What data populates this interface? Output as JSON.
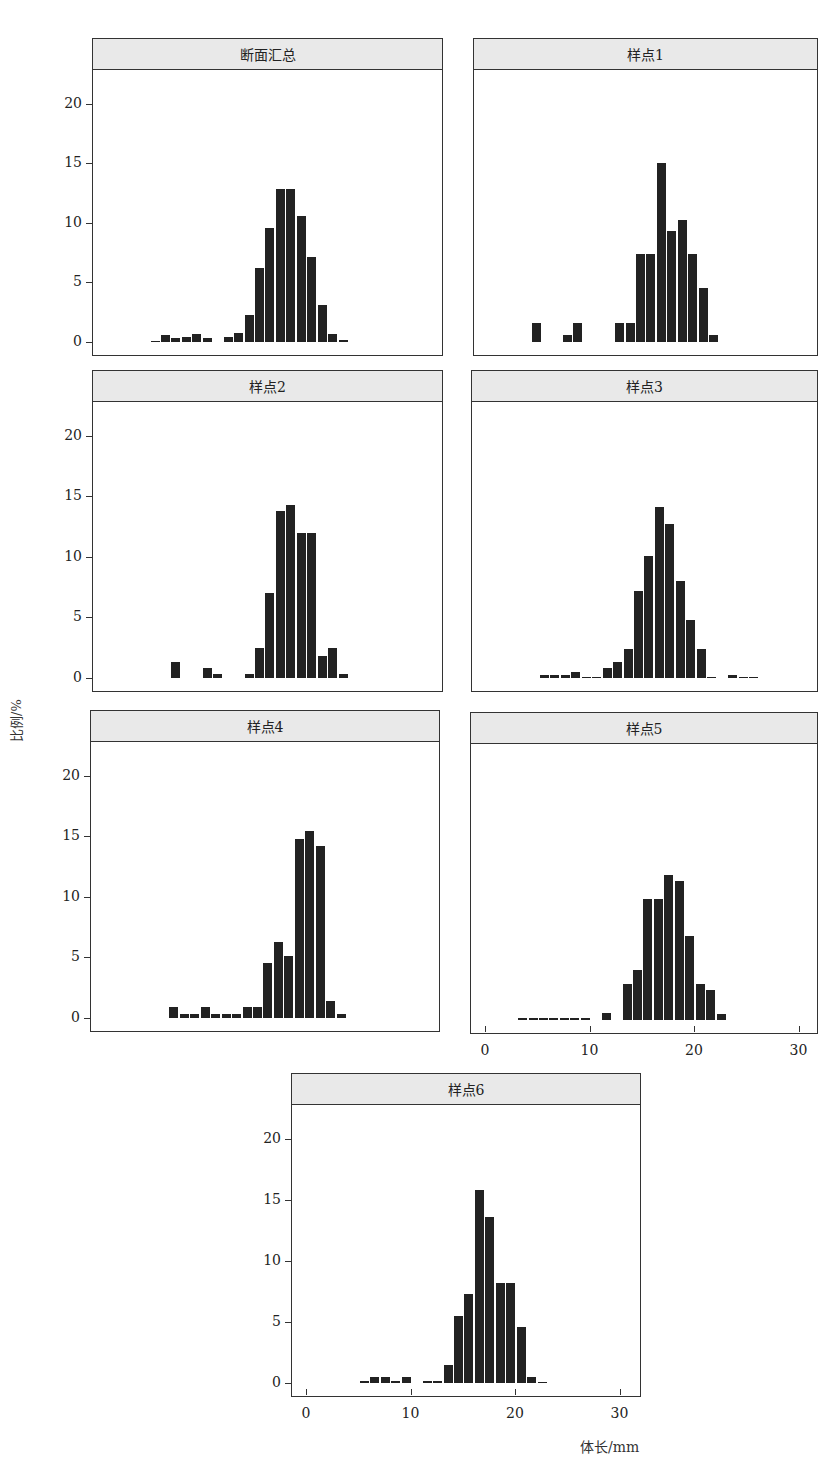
{
  "figure": {
    "y_axis_title": "比例/%",
    "x_axis_title": "体长/mm",
    "caption": "图"
  },
  "chart_data": [
    {
      "type": "bar",
      "title": "断面汇总",
      "xlabel": "体长/mm",
      "ylabel": "比例/%",
      "xlim": [
        0,
        30
      ],
      "ylim": [
        0,
        20
      ],
      "yticks": [
        0,
        5,
        10,
        15,
        20
      ],
      "x": [
        4,
        5,
        6,
        7,
        8,
        9,
        11,
        12,
        13,
        14,
        15,
        16,
        17,
        18,
        19,
        20,
        21,
        22
      ],
      "values": [
        0.1,
        0.6,
        0.3,
        0.4,
        0.7,
        0.3,
        0.4,
        0.75,
        2.3,
        6.2,
        9.6,
        12.8,
        12.8,
        10.6,
        7.1,
        3.1,
        0.65,
        0.2
      ]
    },
    {
      "type": "bar",
      "title": "样点1",
      "xlabel": "体长/mm",
      "ylabel": "比例/%",
      "xlim": [
        0,
        30
      ],
      "ylim": [
        0,
        20
      ],
      "x": [
        4,
        7,
        8,
        12,
        13,
        14,
        15,
        16,
        17,
        18,
        19,
        20,
        21
      ],
      "values": [
        1.6,
        0.6,
        1.6,
        1.6,
        1.6,
        7.4,
        7.4,
        15.0,
        9.3,
        10.2,
        7.4,
        4.5,
        0.6
      ]
    },
    {
      "type": "bar",
      "title": "样点2",
      "xlabel": "体长/mm",
      "ylabel": "比例/%",
      "xlim": [
        0,
        30
      ],
      "ylim": [
        0,
        20
      ],
      "yticks": [
        0,
        5,
        10,
        15,
        20
      ],
      "x": [
        6,
        9,
        10,
        13,
        14,
        15,
        16,
        17,
        18,
        19,
        20,
        21,
        22
      ],
      "values": [
        1.3,
        0.8,
        0.3,
        0.3,
        2.5,
        7.0,
        13.8,
        14.3,
        12.0,
        12.0,
        1.8,
        2.5,
        0.3
      ]
    },
    {
      "type": "bar",
      "title": "样点3",
      "xlabel": "体长/mm",
      "ylabel": "比例/%",
      "xlim": [
        0,
        30
      ],
      "ylim": [
        0,
        20
      ],
      "x": [
        5,
        6,
        7,
        8,
        9,
        10,
        11,
        12,
        13,
        14,
        15,
        16,
        17,
        18,
        19,
        20,
        21,
        23,
        24,
        25
      ],
      "values": [
        0.25,
        0.25,
        0.25,
        0.5,
        0.05,
        0.05,
        0.8,
        1.3,
        2.4,
        7.2,
        10.1,
        14.1,
        12.7,
        8.0,
        4.8,
        2.4,
        0,
        0.25,
        0.05,
        0.05
      ]
    },
    {
      "type": "bar",
      "title": "样点4",
      "xlabel": "体长/mm",
      "ylabel": "比例/%",
      "xlim": [
        0,
        30
      ],
      "ylim": [
        0,
        20
      ],
      "yticks": [
        0,
        5,
        10,
        15,
        20
      ],
      "x": [
        6,
        7,
        8,
        9,
        10,
        11,
        12,
        13,
        14,
        15,
        16,
        17,
        18,
        19,
        20,
        21,
        22
      ],
      "values": [
        0.9,
        0.3,
        0.3,
        0.9,
        0.3,
        0.3,
        0.3,
        0.9,
        0.9,
        4.5,
        6.3,
        5.1,
        14.8,
        15.4,
        14.2,
        1.4,
        0.3
      ]
    },
    {
      "type": "bar",
      "title": "样点5",
      "xlabel": "体长/mm",
      "ylabel": "比例/%",
      "xlim": [
        0,
        30
      ],
      "ylim": [
        0,
        20
      ],
      "xticks": [
        0,
        10,
        20,
        30
      ],
      "x": [
        3,
        4,
        5,
        6,
        7,
        8,
        9,
        11,
        13,
        14,
        15,
        16,
        17,
        18,
        19,
        20,
        21,
        22
      ],
      "values": [
        0.15,
        0.15,
        0.15,
        0.15,
        0.15,
        0.15,
        0.15,
        0.6,
        3.0,
        4.1,
        10.0,
        10.0,
        12.0,
        11.5,
        6.9,
        3.0,
        2.5,
        0.5
      ]
    },
    {
      "type": "bar",
      "title": "样点6",
      "xlabel": "体长/mm",
      "ylabel": "比例/%",
      "xlim": [
        0,
        30
      ],
      "ylim": [
        0,
        20
      ],
      "yticks": [
        0,
        5,
        10,
        15,
        20
      ],
      "xticks": [
        0,
        10,
        20,
        30
      ],
      "x": [
        5,
        6,
        7,
        8,
        9,
        11,
        12,
        13,
        14,
        15,
        16,
        17,
        18,
        19,
        20,
        21,
        22
      ],
      "values": [
        0.15,
        0.5,
        0.5,
        0.15,
        0.5,
        0.15,
        0.15,
        1.5,
        5.5,
        7.3,
        15.8,
        13.6,
        8.2,
        8.2,
        4.6,
        0.5,
        0.1
      ]
    }
  ],
  "layout": [
    {
      "left": 92,
      "top": 38,
      "width": 351,
      "height": 318,
      "yaxis": true,
      "xaxis": false
    },
    {
      "left": 473,
      "top": 38,
      "width": 345,
      "height": 318,
      "yaxis": false,
      "xaxis": false
    },
    {
      "left": 92,
      "top": 370,
      "width": 351,
      "height": 322,
      "yaxis": true,
      "xaxis": false
    },
    {
      "left": 471,
      "top": 370,
      "width": 347,
      "height": 322,
      "yaxis": false,
      "xaxis": false
    },
    {
      "left": 90,
      "top": 710,
      "width": 350,
      "height": 322,
      "yaxis": true,
      "xaxis": false
    },
    {
      "left": 470,
      "top": 712,
      "width": 348,
      "height": 322,
      "yaxis": false,
      "xaxis": true
    },
    {
      "left": 291,
      "top": 1073,
      "width": 350,
      "height": 324,
      "yaxis": true,
      "xaxis": true
    }
  ]
}
